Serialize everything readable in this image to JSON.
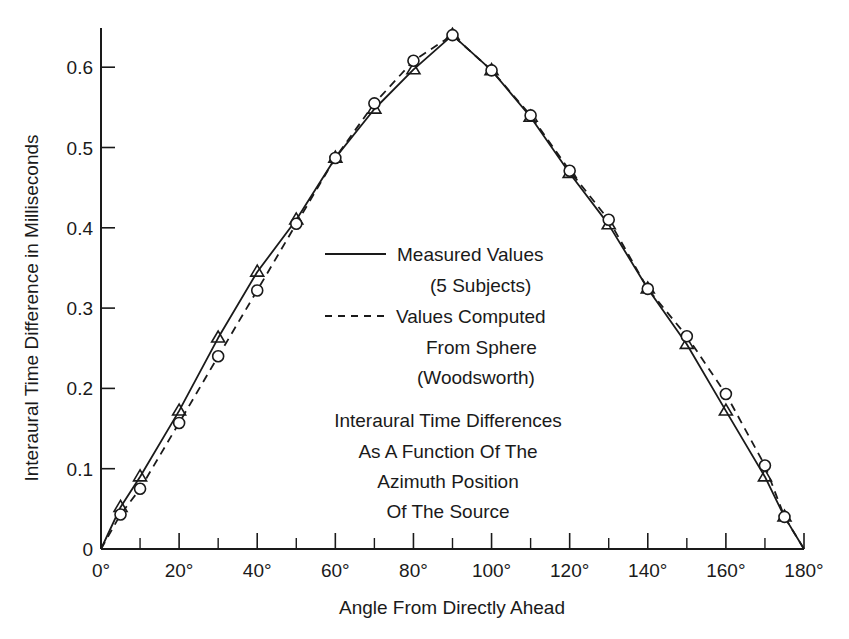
{
  "chart_data": {
    "type": "line",
    "title_lines": [
      "Interaural Time Differences",
      "As A Function Of The",
      "Azimuth Position",
      "Of The Source"
    ],
    "xlabel": "Angle From Directly Ahead",
    "ylabel": "Interaural Time Difference in Milliseconds",
    "xlim": [
      0,
      180
    ],
    "ylim": [
      0,
      0.65
    ],
    "grid": false,
    "legend_position": "center",
    "x_ticks": [
      "0°",
      "20°",
      "40°",
      "60°",
      "80°",
      "100°",
      "120°",
      "140°",
      "160°",
      "180°"
    ],
    "x_tick_values": [
      0,
      20,
      40,
      60,
      80,
      100,
      120,
      140,
      160,
      180
    ],
    "x_minor_ticks": [
      10,
      30,
      50,
      70,
      90,
      110,
      130,
      150,
      170
    ],
    "y_ticks": [
      "0",
      "0.1",
      "0.2",
      "0.3",
      "0.4",
      "0.5",
      "0.6"
    ],
    "y_tick_values": [
      0,
      0.1,
      0.2,
      0.3,
      0.4,
      0.5,
      0.6
    ],
    "legend": [
      {
        "style": "solid",
        "marker": "triangle",
        "lines": [
          "Measured Values",
          "(5 Subjects)"
        ]
      },
      {
        "style": "dashed",
        "marker": "circle",
        "lines": [
          "Values Computed",
          "From Sphere",
          "(Woodsworth)"
        ]
      }
    ],
    "x": [
      0,
      5,
      10,
      20,
      30,
      40,
      50,
      60,
      70,
      80,
      90,
      100,
      110,
      120,
      130,
      140,
      150,
      160,
      170,
      175,
      180
    ],
    "series": [
      {
        "name": "Measured Values (5 Subjects)",
        "line": "solid",
        "marker": "triangle",
        "values": [
          0,
          0.052,
          0.09,
          0.172,
          0.263,
          0.345,
          0.41,
          0.487,
          0.548,
          0.597,
          0.64,
          0.596,
          0.538,
          0.468,
          0.404,
          0.324,
          0.255,
          0.172,
          0.09,
          0.04,
          0
        ]
      },
      {
        "name": "Values Computed From Sphere (Woodsworth)",
        "line": "dashed",
        "marker": "circle",
        "values": [
          0,
          0.043,
          0.075,
          0.157,
          0.24,
          0.322,
          0.405,
          0.487,
          0.555,
          0.608,
          0.64,
          0.596,
          0.54,
          0.471,
          0.41,
          0.324,
          0.265,
          0.193,
          0.104,
          0.04,
          0
        ]
      }
    ]
  }
}
